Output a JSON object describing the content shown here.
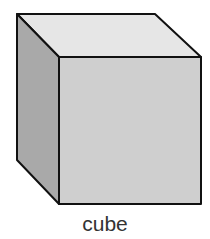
{
  "diagram": {
    "shape": "cube",
    "label": "cube",
    "colors": {
      "top_face": "#e6e6e6",
      "front_face": "#cfcfcf",
      "side_face": "#a9a9a9",
      "edge": "#111111",
      "label": "#333333"
    }
  }
}
